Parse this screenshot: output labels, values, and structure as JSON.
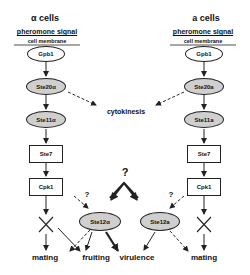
{
  "left_column": {
    "title": "α cells",
    "signal": "pheromone signal",
    "membrane": "cell membrane",
    "nodes": {
      "gpb1": "Gpb1",
      "ste20": "Ste20α",
      "ste11": "Ste11α",
      "ste7": "Ste7",
      "cpk1": "Cpk1",
      "ste12": "Ste12α"
    }
  },
  "right_column": {
    "title": "a cells",
    "signal": "pheromone signal",
    "membrane": "cell membrane",
    "nodes": {
      "gpb1": "Gpb1",
      "ste20": "Ste20a",
      "ste11": "Ste11a",
      "ste7": "Ste7",
      "cpk1": "Cpk1",
      "ste12": "Ste12a"
    }
  },
  "shared": {
    "cytokinesis": "cytokinesis",
    "unknown_mark": "?"
  },
  "outcomes": {
    "mating_left": "mating",
    "fruiting": "fruiting",
    "virulence": "virulence",
    "mating_right": "mating"
  },
  "colors": {
    "kinase_fill": "#cfcfcf",
    "line": "#222222"
  }
}
